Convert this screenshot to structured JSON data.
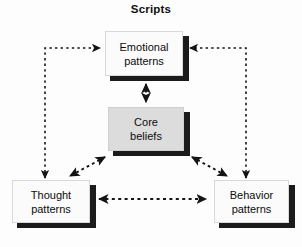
{
  "figure": {
    "title": "Scripts",
    "type": "cycle-diagram",
    "background_color": "#fdfdfd"
  },
  "colors": {
    "node_fill_white": "#fbfbfb",
    "node_fill_gray": "#dcdcdc",
    "shadow": "#1b1b1b",
    "arrow": "#141414",
    "text": "#0c0c0c"
  },
  "nodes": [
    {
      "id": "emotional",
      "line1": "Emotional",
      "line2": "patterns",
      "fill": "white",
      "x": 105,
      "y": 31,
      "w": 78,
      "h": 45
    },
    {
      "id": "core",
      "line1": "Core",
      "line2": "beliefs",
      "fill": "gray",
      "x": 108,
      "y": 107,
      "w": 76,
      "h": 44
    },
    {
      "id": "thought",
      "line1": "Thought",
      "line2": "patterns",
      "fill": "white",
      "x": 12,
      "y": 180,
      "w": 78,
      "h": 43
    },
    {
      "id": "behavior",
      "line1": "Behavior",
      "line2": "patterns",
      "fill": "white",
      "x": 214,
      "y": 180,
      "w": 75,
      "h": 43
    }
  ],
  "connectors": [
    {
      "id": "thought-to-emotional",
      "style": "dotted",
      "heads": "single",
      "path": "left-elbow"
    },
    {
      "id": "behavior-to-emotional",
      "style": "dotted",
      "heads": "single",
      "path": "right-elbow"
    },
    {
      "id": "emotional-core",
      "style": "dashed",
      "heads": "double",
      "path": "vertical"
    },
    {
      "id": "core-thought",
      "style": "dashed",
      "heads": "double",
      "path": "diagonal-left"
    },
    {
      "id": "core-behavior",
      "style": "dashed",
      "heads": "double",
      "path": "diagonal-right"
    },
    {
      "id": "thought-behavior",
      "style": "dashed",
      "heads": "double",
      "path": "horizontal"
    }
  ]
}
